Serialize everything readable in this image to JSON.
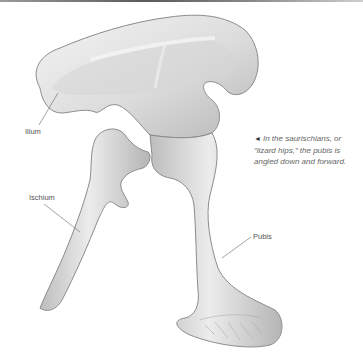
{
  "figure": {
    "labels": {
      "ilium": "Ilium",
      "ischium": "Ischium",
      "pubis": "Pubis"
    },
    "caption": {
      "pointer_icon": "◄",
      "text": "In the saurischians, or “lizard hips,” the pubis is angled down and forward."
    },
    "colors": {
      "bone_light": "#efefef",
      "bone_mid": "#cfcfcf",
      "bone_shadow": "#9a9a9a",
      "leader_line": "#666666",
      "label_text": "#555555"
    }
  }
}
